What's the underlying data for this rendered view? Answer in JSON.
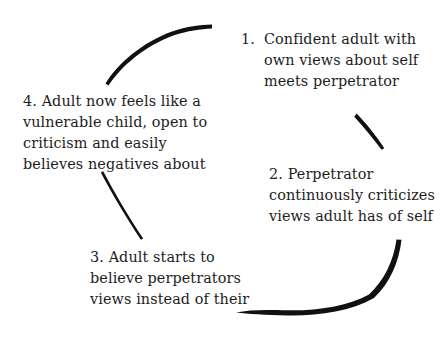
{
  "diagram": {
    "type": "cycle",
    "background_color": "#ffffff",
    "stroke_color": "#111111",
    "steps": [
      {
        "number": "1.",
        "text": "Confident adult with\nown views about self\nmeets perpetrator",
        "position": "top-right"
      },
      {
        "number": "2.",
        "text": "Perpetrator\ncontinuously criticizes\nviews adult has of self",
        "position": "right"
      },
      {
        "number": "3.",
        "text": "Adult starts to\nbelieve perpetrators\nviews instead of their",
        "position": "bottom-left"
      },
      {
        "number": "4.",
        "text": "Adult now feels like a\nvulnerable child, open to\ncriticism and easily\nbelieves negatives about",
        "position": "left"
      }
    ],
    "connectors": [
      {
        "name": "arc-top-left",
        "from_step": "4",
        "to_step": "1",
        "description": "thick tapered arc curving up from left to top",
        "start": [
          105,
          83
        ],
        "end": [
          212,
          25
        ]
      },
      {
        "name": "arc-right-upper",
        "from_step": "1",
        "to_step": "2",
        "description": "short tapered stroke descending to the right",
        "start": [
          357,
          114
        ],
        "end": [
          384,
          148
        ]
      },
      {
        "name": "arc-bottom-right",
        "from_step": "2",
        "to_step": "3",
        "description": "long thick arc sweeping down and left along the bottom",
        "start": [
          401,
          240
        ],
        "end": [
          236,
          313
        ]
      },
      {
        "name": "arc-left-lower",
        "from_step": "4",
        "to_step": "3",
        "description": "thin stroke descending from left block toward bottom-left block",
        "start": [
          103,
          171
        ],
        "end": [
          143,
          239
        ]
      }
    ]
  }
}
